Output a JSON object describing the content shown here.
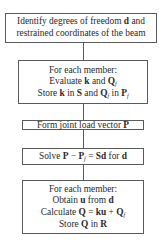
{
  "flowchart": {
    "steps": [
      {
        "id": "identify-dof",
        "lines": [
          {
            "text": "Identify degrees of freedom ",
            "bold": "d",
            "after": " and"
          },
          {
            "text": "restrained coordinates of the beam"
          }
        ]
      },
      {
        "id": "member-stiffness",
        "lines": [
          {
            "text": "For each member:"
          },
          {
            "pre": "Evaluate ",
            "k": "k",
            "mid": " and ",
            "Q": "Q",
            "Qsub": "f"
          },
          {
            "pre": "Store ",
            "k": "k",
            "mid1": " in ",
            "S": "S",
            "mid2": " and ",
            "Q": "Q",
            "Qsub": "f",
            "mid3": " in ",
            "P": "P",
            "Psub": "f"
          }
        ]
      },
      {
        "id": "joint-load",
        "lines": [
          {
            "pre": "Form joint load vector ",
            "P": "P"
          }
        ]
      },
      {
        "id": "solve",
        "lines": [
          {
            "pre": "Solve ",
            "P": "P",
            "minus": " − ",
            "Pf": "P",
            "Pfsub": "f",
            "eq": " = ",
            "Sd": "Sd",
            "mid": " for ",
            "d": "d"
          }
        ]
      },
      {
        "id": "member-forces",
        "lines": [
          {
            "text": "For each member:"
          },
          {
            "pre": "Obtain ",
            "u": "u",
            "mid": " from ",
            "d": "d"
          },
          {
            "pre": "Calculate ",
            "Q": "Q",
            "eq": " = ",
            "ku": "ku",
            "plus": " + ",
            "Qf": "Q",
            "Qfsub": "f"
          },
          {
            "pre": "Store ",
            "Q": "Q",
            "mid": " in ",
            "R": "R"
          }
        ]
      }
    ],
    "colors": {
      "border": "#5a5a5a",
      "text": "#2a2a2a",
      "background": "#ffffff"
    }
  }
}
